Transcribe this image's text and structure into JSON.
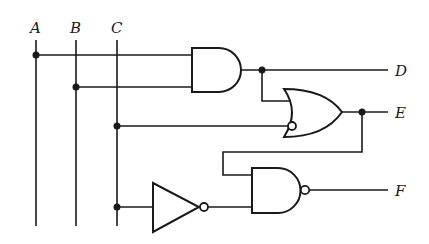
{
  "diagram": {
    "type": "logic-circuit",
    "inputs": [
      {
        "label": "A",
        "x": 36
      },
      {
        "label": "B",
        "x": 76
      },
      {
        "label": "C",
        "x": 117
      }
    ],
    "outputs": [
      {
        "label": "D",
        "expression": "A·B"
      },
      {
        "label": "E",
        "expression": "D + C'"
      },
      {
        "label": "F",
        "expression": "(E · C')'"
      }
    ],
    "gates": [
      {
        "name": "and-gate",
        "type": "AND",
        "inputs": [
          "A",
          "B"
        ],
        "output": "D"
      },
      {
        "name": "or-gate",
        "type": "OR",
        "inputs": [
          "D",
          "NOT C (bubble)"
        ],
        "output": "E"
      },
      {
        "name": "not-gate",
        "type": "NOT",
        "inputs": [
          "C"
        ],
        "output": "C'"
      },
      {
        "name": "nand-gate",
        "type": "NAND",
        "inputs": [
          "E",
          "C'"
        ],
        "output": "F"
      }
    ],
    "colors": {
      "ink": "#1a1a1a",
      "background": "#ffffff"
    }
  }
}
